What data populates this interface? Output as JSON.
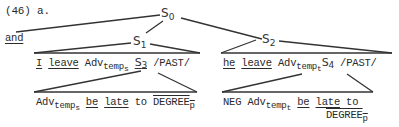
{
  "example_label": "(46) a.",
  "nodes": {
    "s0": {
      "base": "S",
      "sub": "0"
    },
    "s1": {
      "base": "S",
      "sub": "1"
    },
    "s2": {
      "base": "S",
      "sub": "2"
    },
    "s3": {
      "base": "S",
      "sub": "3"
    },
    "s4": {
      "base": "S",
      "sub": "4"
    }
  },
  "conjunction": "and",
  "s1_children": {
    "w1": "I",
    "w2": "leave",
    "adv": "Adv",
    "adv_sub": "temp",
    "adv_subsub": "s",
    "tense": "/PAST/"
  },
  "s2_children": {
    "w1": "he",
    "w2": "leave",
    "adv": "Adv",
    "adv_sub": "temp",
    "adv_subsub": "t",
    "tense": "/PAST/"
  },
  "s3_children": {
    "adv": "Adv",
    "adv_sub": "temp",
    "adv_subsub": "s",
    "w1": "be",
    "w2": "late",
    "w3": "to",
    "degree": "DEGREE",
    "degree_sub": "p"
  },
  "s4_children": {
    "neg": "NEG",
    "adv": "Adv",
    "adv_sub": "temp",
    "adv_subsub": "t",
    "w1": "be",
    "w2": "late",
    "w3": "to",
    "degree": "DEGREE",
    "degree_sub": "p"
  }
}
